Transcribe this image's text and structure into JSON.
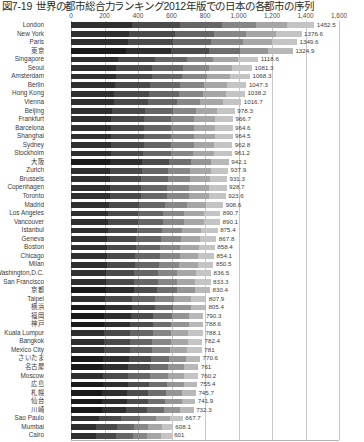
{
  "chart_data": {
    "type": "bar",
    "orientation": "horizontal",
    "stacked": true,
    "title_number": "図7-19",
    "title_text": "世界の都市総合力ランキング2012年版での日本の各都市の序列",
    "xlabel": "",
    "ylabel": "",
    "xlim": [
      0,
      1600
    ],
    "xticks": [
      0,
      200,
      400,
      600,
      800,
      1000,
      1200,
      1400,
      1600
    ],
    "xtick_labels": [
      "0",
      "200",
      "400",
      "600",
      "800",
      "1,000",
      "1,200",
      "1,400",
      "1,600"
    ],
    "grid": true,
    "legend": "none",
    "categories": [
      "London",
      "New York",
      "Paris",
      "東京",
      "Singapore",
      "Seoul",
      "Amsterdam",
      "Berlin",
      "Hong Kong",
      "Vienna",
      "Beijing",
      "Frankfurt",
      "Barcelona",
      "Shanghai",
      "Sydney",
      "Stockholm",
      "大阪",
      "Zurich",
      "Brussels",
      "Copenhagen",
      "Toronto",
      "Madrid",
      "Los Angeles",
      "Vancouver",
      "Istanbul",
      "Geneva",
      "Boston",
      "Chicago",
      "Milan",
      "Washington,D.C.",
      "San Francisco",
      "京都",
      "Taipei",
      "横浜",
      "福岡",
      "神戸",
      "Kuala Lumpur",
      "Bangkok",
      "Mexico City",
      "さいたま",
      "名古屋",
      "Moscow",
      "広島",
      "札幌",
      "仙台",
      "川崎",
      "Sao Paulo",
      "Mumbai",
      "Cairo"
    ],
    "values": [
      1452.5,
      1376.6,
      1349.6,
      1324.9,
      1118.6,
      1081.3,
      1068.3,
      1047.3,
      1038.2,
      1016.7,
      978.3,
      966.7,
      964.6,
      964.5,
      962.8,
      961.2,
      942.1,
      937.9,
      931.3,
      928.7,
      923.6,
      908.6,
      890.7,
      890.1,
      875.4,
      867.8,
      858.4,
      854.1,
      850.5,
      836.5,
      833.3,
      830.4,
      807.9,
      805.4,
      790.3,
      788.6,
      788.1,
      782.4,
      781,
      770.6,
      761,
      760.2,
      755.4,
      745.7,
      741.9,
      732.3,
      667.7,
      608.1,
      601
    ],
    "value_labels": [
      "1452.5",
      "1376.6",
      "1349.6",
      "1324.9",
      "1118.6",
      "1081.3",
      "1068.3",
      "1047.3",
      "1038.2",
      "1016.7",
      "978.3",
      "966.7",
      "964.6",
      "964.5",
      "962.8",
      "961.2",
      "942.1",
      "937.9",
      "931.3",
      "928.7",
      "923.6",
      "908.6",
      "890.7",
      "890.1",
      "875.4",
      "867.8",
      "858.4",
      "854.1",
      "850.5",
      "836.5",
      "833.3",
      "830.4",
      "807.9",
      "805.4",
      "790.3",
      "788.6",
      "788.1",
      "782.4",
      "781",
      "770.6",
      "761",
      "760.2",
      "755.4",
      "745.7",
      "741.9",
      "732.3",
      "667.7",
      "608.1",
      "601"
    ],
    "japanese_cities": [
      "東京",
      "大阪",
      "京都",
      "横浜",
      "福岡",
      "神戸",
      "さいたま",
      "名古屋",
      "広島",
      "札幌",
      "仙台",
      "川崎"
    ],
    "segment_fractions": [
      0.25,
      0.2,
      0.17,
      0.14,
      0.13,
      0.11
    ],
    "segment_colors": [
      "#2f2f2f",
      "#4a4a4a",
      "#666666",
      "#868686",
      "#a6a6a6",
      "#c4c4c4"
    ],
    "segment_colors_jp": [
      "#1a1a1a",
      "#2e2e2e",
      "#4c4c4c",
      "#6e6e6e",
      "#949494",
      "#b8b8b8"
    ],
    "grid_color": "#c8c8c8",
    "text_color": "#3a3a3a"
  }
}
